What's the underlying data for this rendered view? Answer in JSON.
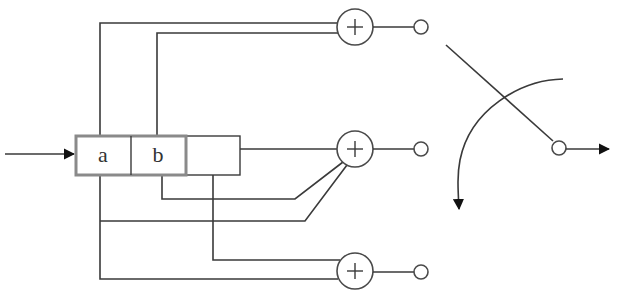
{
  "diagram": {
    "type": "convolutional-encoder",
    "register": {
      "cells": [
        {
          "id": "cell-a",
          "label": "a"
        },
        {
          "id": "cell-b",
          "label": "b"
        },
        {
          "id": "cell-c",
          "label": ""
        }
      ]
    },
    "adders": [
      {
        "id": "adder-top",
        "symbol": "+"
      },
      {
        "id": "adder-middle",
        "symbol": "+"
      },
      {
        "id": "adder-bottom",
        "symbol": "+"
      }
    ],
    "input_arrow": {
      "direction": "right"
    },
    "commutator": {
      "rotation": "counter-clockwise",
      "output_direction": "right"
    },
    "colors": {
      "line": "#3a3a3a",
      "register_border": "#8a8a8a",
      "background": "#ffffff"
    }
  }
}
